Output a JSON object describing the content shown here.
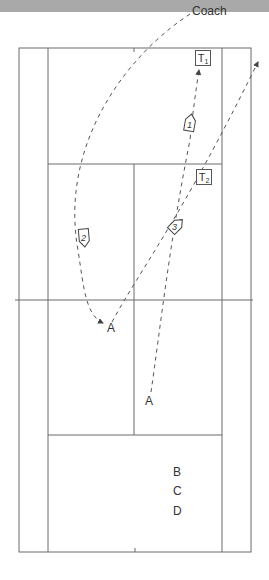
{
  "diagram": {
    "type": "tennis-court-drill",
    "labels": {
      "coach": "Coach",
      "target1_letter": "T",
      "target1_sub": "1",
      "target2_letter": "T",
      "target2_sub": "2",
      "player_a_near": "A",
      "player_a_far": "A",
      "waiting_b": "B",
      "waiting_c": "C",
      "waiting_d": "D"
    },
    "markers": [
      {
        "id": "1",
        "label": "1"
      },
      {
        "id": "2",
        "label": "2"
      },
      {
        "id": "3",
        "label": "3"
      }
    ],
    "colors": {
      "line": "#666666",
      "path": "#555555",
      "band": "#a9a9a9",
      "background": "#ffffff"
    }
  }
}
